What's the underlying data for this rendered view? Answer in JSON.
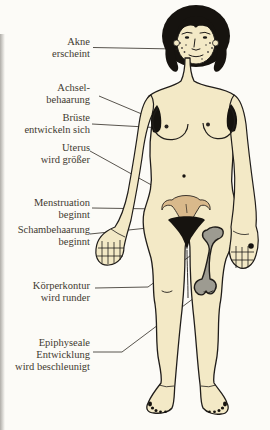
{
  "diagram": {
    "figure": "female-body-front-view",
    "labels": [
      {
        "id": "akne",
        "text": "Akne\nerscheint",
        "target": "cheek-acne"
      },
      {
        "id": "achsel",
        "text": "Achsel-\nbehaarung",
        "target": "armpit-hair"
      },
      {
        "id": "brueste",
        "text": "Brüste\nentwickeln sich",
        "target": "breast"
      },
      {
        "id": "uterus",
        "text": "Uterus\nwird größer",
        "target": "uterus"
      },
      {
        "id": "menstruation",
        "text": "Menstruation\nbeginnt",
        "target": "uterus-left-side"
      },
      {
        "id": "schambehaarung",
        "text": "Schambehaarung\nbeginnt",
        "target": "pubic-hair"
      },
      {
        "id": "koerperkontur",
        "text": "Körperkontur\nwird runder",
        "target": "hip-thigh-contour"
      },
      {
        "id": "epiphyse",
        "text": "Epiphyseale\nEntwicklung\nwird beschleunigt",
        "target": "knee-epiphysis-femur"
      }
    ],
    "colors": {
      "background": "#fcfbf7",
      "skin": "#f3e9c6",
      "outline": "#201d1a",
      "hair": "#16130f",
      "uterus": "#d9b98b",
      "bone": "#9d9b91",
      "label_text": "#3f3a30",
      "pointer_line": "#45413a"
    }
  }
}
